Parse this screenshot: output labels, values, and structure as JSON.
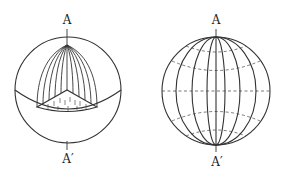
{
  "figure": {
    "type": "geometric-diagram",
    "left_sphere": {
      "top_label": "A",
      "bottom_label": "A′",
      "content": "Sphere cut by a plane through the equator revealing a cone-like wedge of meridian arcs converging at the top pole; base triangle with hatch marks"
    },
    "right_sphere": {
      "top_label": "A",
      "bottom_label": "A′",
      "content": "Sphere with solid meridians through poles A and A′ and dashed parallels of latitude"
    }
  },
  "colors": {
    "line": "#333333",
    "dashed": "#555555",
    "background": "#ffffff"
  }
}
